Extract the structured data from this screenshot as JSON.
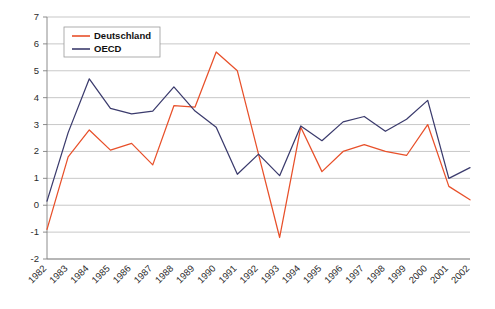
{
  "chart_data": {
    "type": "line",
    "title": "",
    "subtitle": "",
    "xlabel": "",
    "ylabel": "",
    "grid": true,
    "legend_position": "top-left",
    "x": [
      "1982",
      "1983",
      "1984",
      "1985",
      "1986",
      "1987",
      "1988",
      "1989",
      "1990",
      "1991",
      "1992",
      "1993",
      "1994",
      "1995",
      "1996",
      "1997",
      "1998",
      "1999",
      "2000",
      "2001",
      "2002"
    ],
    "categories": [
      "1982",
      "1983",
      "1984",
      "1985",
      "1986",
      "1987",
      "1988",
      "1989",
      "1990",
      "1991",
      "1992",
      "1993",
      "1994",
      "1995",
      "1996",
      "1997",
      "1998",
      "1999",
      "2000",
      "2001",
      "2002"
    ],
    "xlim": [
      "1982",
      "2002"
    ],
    "ylim": [
      -2,
      7
    ],
    "yticks": [
      7,
      6,
      5,
      4,
      3,
      2,
      1,
      0,
      -1,
      -2
    ],
    "series": [
      {
        "name": "Deutschland",
        "color": "#e8502a",
        "values": [
          -0.9,
          1.8,
          2.8,
          2.05,
          2.3,
          1.5,
          3.7,
          3.65,
          5.7,
          5.0,
          1.9,
          -1.2,
          2.9,
          1.25,
          2.0,
          2.25,
          2.0,
          1.85,
          3.0,
          0.7,
          0.2
        ]
      },
      {
        "name": "OECD",
        "color": "#3b3b6d",
        "values": [
          0.15,
          2.7,
          4.7,
          3.6,
          3.4,
          3.5,
          4.4,
          3.5,
          2.9,
          1.15,
          1.9,
          1.1,
          2.95,
          2.4,
          3.1,
          3.3,
          2.75,
          3.2,
          3.9,
          1.0,
          1.4
        ]
      }
    ],
    "legend": [
      {
        "label": "Deutschland",
        "color": "#e8502a"
      },
      {
        "label": "OECD",
        "color": "#3b3b6d"
      }
    ],
    "axis": {
      "y_tick_labels": [
        "7",
        "6",
        "5",
        "4",
        "3",
        "2",
        "1",
        "0",
        "-1",
        "-2"
      ],
      "x_tick_labels": [
        "1982",
        "1983",
        "1984",
        "1985",
        "1986",
        "1987",
        "1988",
        "1989",
        "1990",
        "1991",
        "1992",
        "1993",
        "1994",
        "1995",
        "1996",
        "1997",
        "1998",
        "1999",
        "2000",
        "2001",
        "2002"
      ],
      "x_label_rotation_deg": -45
    },
    "colors": {
      "deutschland": "#e8502a",
      "oecd": "#3b3b6d",
      "gridline": "#b0b0b0",
      "background": "#ffffff"
    }
  }
}
